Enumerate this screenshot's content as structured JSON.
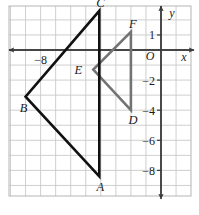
{
  "figure": {
    "background_color": "#ffffff",
    "grid_color": "#c9c9c9",
    "frame_color": "#b5b5b5",
    "axis_color": "#3b3b3b",
    "triangle_abc_color": "#111111",
    "triangle_def_color": "#737373"
  },
  "axes": {
    "x_axis_label": "x",
    "y_axis_label": "y",
    "origin_label": "O",
    "x_ticks": [
      {
        "value": -8,
        "label": "−8"
      }
    ],
    "y_ticks": [
      {
        "value": 1,
        "label": "1"
      },
      {
        "value": -2,
        "label": "−2"
      },
      {
        "value": -4,
        "label": "−4"
      },
      {
        "value": -6,
        "label": "−6"
      },
      {
        "value": -8,
        "label": "−8"
      }
    ],
    "x_range": [
      -10.2,
      2.0
    ],
    "y_range": [
      -9.8,
      3.0
    ],
    "grid_spacing": 1,
    "grid_visible": true
  },
  "shapes": {
    "triangle_abc": {
      "name": "triangle ABC",
      "color": "#111111",
      "stroke_width": 2.6,
      "vertices": [
        {
          "label": "A",
          "x": -4.1,
          "y": -8.4,
          "label_dx": 1,
          "label_dy": 15
        },
        {
          "label": "B",
          "x": -9.0,
          "y": -3.1,
          "label_dx": -2,
          "label_dy": 15
        },
        {
          "label": "C",
          "x": -4.1,
          "y": 2.6,
          "label_dx": 1,
          "label_dy": -4
        }
      ]
    },
    "triangle_def": {
      "name": "triangle DEF",
      "color": "#737373",
      "stroke_width": 2.6,
      "vertices": [
        {
          "label": "D",
          "x": -2.0,
          "y": -4.0,
          "label_dx": 2,
          "label_dy": 14
        },
        {
          "label": "E",
          "x": -4.5,
          "y": -1.3,
          "label_dx": -15,
          "label_dy": 4
        },
        {
          "label": "F",
          "x": -2.0,
          "y": 1.2,
          "label_dx": 2,
          "label_dy": -4
        }
      ]
    }
  }
}
